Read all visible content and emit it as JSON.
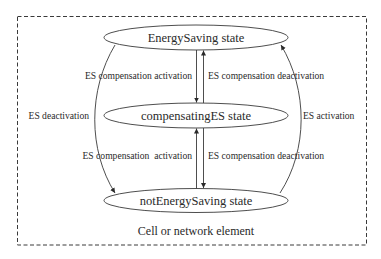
{
  "diagram": {
    "type": "state-diagram",
    "container": {
      "label": "Cell or network element",
      "border_style": "dashed"
    },
    "states": [
      {
        "id": "energy_saving",
        "label": "EnergySaving state"
      },
      {
        "id": "compensating_es",
        "label": "compensatingES state"
      },
      {
        "id": "not_energy_saving",
        "label": "notEnergySaving state"
      }
    ],
    "transitions": [
      {
        "from": "energy_saving",
        "to": "compensating_es",
        "label": "ES compensation activation"
      },
      {
        "from": "compensating_es",
        "to": "energy_saving",
        "label": "ES compensation deactivation"
      },
      {
        "from": "not_energy_saving",
        "to": "compensating_es",
        "label": "ES compensation  activation"
      },
      {
        "from": "compensating_es",
        "to": "not_energy_saving",
        "label": "ES compensation deactivation"
      },
      {
        "from": "energy_saving",
        "to": "not_energy_saving",
        "label": "ES deactivation"
      },
      {
        "from": "not_energy_saving",
        "to": "energy_saving",
        "label": "ES activation"
      }
    ],
    "colors": {
      "line": "#3a3a3a",
      "text": "#2a2a2a",
      "background": "#ffffff"
    }
  }
}
